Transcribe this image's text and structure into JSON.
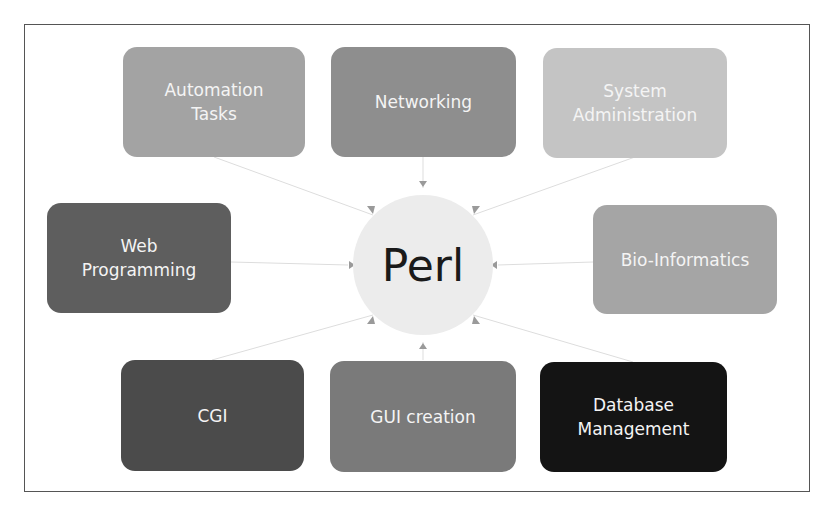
{
  "diagram": {
    "type": "hub-and-spoke",
    "center": {
      "label": "Perl",
      "color": "#ececec",
      "text_color": "#1a1a1a"
    },
    "nodes": [
      {
        "id": "automation-tasks",
        "lines": [
          "Automation",
          "Tasks"
        ],
        "color": "#a3a3a3",
        "position": "top-left"
      },
      {
        "id": "networking",
        "lines": [
          "Networking"
        ],
        "color": "#8e8e8e",
        "position": "top-center"
      },
      {
        "id": "system-administration",
        "lines": [
          "System",
          "Administration"
        ],
        "color": "#c4c4c4",
        "position": "top-right"
      },
      {
        "id": "web-programming",
        "lines": [
          "Web",
          "Programming"
        ],
        "color": "#5e5e5e",
        "position": "middle-left"
      },
      {
        "id": "bio-informatics",
        "lines": [
          "Bio-Informatics"
        ],
        "color": "#a5a5a5",
        "position": "middle-right"
      },
      {
        "id": "cgi",
        "lines": [
          "CGI"
        ],
        "color": "#4b4b4b",
        "position": "bottom-left"
      },
      {
        "id": "gui-creation",
        "lines": [
          "GUI creation"
        ],
        "color": "#7a7a7a",
        "position": "bottom-center"
      },
      {
        "id": "database-management",
        "lines": [
          "Database",
          "Management"
        ],
        "color": "#141414",
        "position": "bottom-right"
      }
    ],
    "edges": [
      {
        "from": "automation-tasks",
        "to": "Perl"
      },
      {
        "from": "networking",
        "to": "Perl"
      },
      {
        "from": "system-administration",
        "to": "Perl"
      },
      {
        "from": "web-programming",
        "to": "Perl"
      },
      {
        "from": "bio-informatics",
        "to": "Perl"
      },
      {
        "from": "cgi",
        "to": "Perl"
      },
      {
        "from": "gui-creation",
        "to": "Perl"
      },
      {
        "from": "database-management",
        "to": "Perl"
      }
    ],
    "frame_border_color": "#555555",
    "connector_color": "#d8d8d8",
    "arrowhead_color": "#9a9a9a"
  }
}
